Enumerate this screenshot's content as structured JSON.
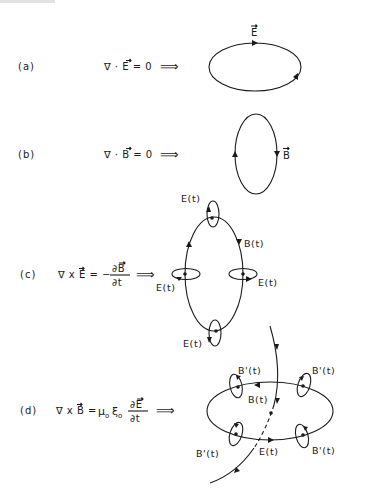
{
  "figure": {
    "rows": [
      {
        "id": "a",
        "label": "(a)",
        "equation": {
          "lhs": "∇ · E = 0",
          "arrow": "⟹",
          "vector_symbols": [
            "E"
          ]
        },
        "diagram": {
          "shape": "horizontal closed loop",
          "field_label": "E",
          "field_label_vector": true
        }
      },
      {
        "id": "b",
        "label": "(b)",
        "equation": {
          "lhs": "∇ · B = 0",
          "arrow": "⟹",
          "vector_symbols": [
            "B"
          ]
        },
        "diagram": {
          "shape": "vertical closed loop",
          "field_label": "B",
          "field_label_vector": true
        }
      },
      {
        "id": "c",
        "label": "(c)",
        "equation": {
          "lhs": "∇ x E = −",
          "numerator": "∂B",
          "denominator": "∂t",
          "arrow": "⟹",
          "vector_symbols": [
            "E",
            "B"
          ]
        },
        "diagram": {
          "shape": "vertical closed loop with 4 encircling loops",
          "main_label": "B(t)",
          "loop_labels": [
            "E(t)",
            "E(t)",
            "E(t)",
            "E(t)"
          ]
        }
      },
      {
        "id": "d",
        "label": "(d)",
        "equation": {
          "lhs": "∇ x B =",
          "mu": "μ",
          "mu_sub": "o",
          "xi": "ξ",
          "xi_sub": "o",
          "numerator": "∂E",
          "denominator": "∂t",
          "arrow": "⟹",
          "vector_symbols": [
            "B",
            "E"
          ]
        },
        "diagram": {
          "shape": "horizontal closed loop with crossing field line and 4 encircling loops",
          "crossing_line_label": "B(t)",
          "main_label": "E(t)",
          "loop_labels": [
            "B'(t)",
            "B'(t)",
            "B'(t)",
            "B'(t)"
          ]
        }
      }
    ]
  }
}
